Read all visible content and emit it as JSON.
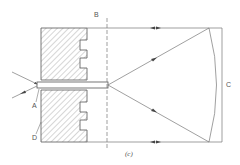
{
  "figure": {
    "caption": "(c)",
    "labels": {
      "A": "A",
      "B": "B",
      "C": "C",
      "D": "D"
    },
    "colors": {
      "line": "#666666",
      "hatch": "#777777",
      "background": "#ffffff"
    },
    "elements": [
      {
        "name": "upper-hatched-block",
        "type": "hatched-block-with-notches"
      },
      {
        "name": "lower-hatched-block",
        "type": "hatched-block-with-notches"
      },
      {
        "name": "central-slab",
        "type": "rectangle"
      },
      {
        "name": "plane-B",
        "type": "dashed-vertical-line"
      },
      {
        "name": "curved-surface",
        "type": "arc"
      },
      {
        "name": "boundary-C",
        "type": "vertical-line"
      },
      {
        "name": "ray-top",
        "type": "arrow-line"
      },
      {
        "name": "ray-bottom",
        "type": "arrow-line"
      },
      {
        "name": "diverging-ray-upper",
        "type": "arrow-line"
      },
      {
        "name": "diverging-ray-lower",
        "type": "arrow-line"
      },
      {
        "name": "incident-ray-upper-left",
        "type": "arrow-line"
      },
      {
        "name": "incident-ray-lower-left",
        "type": "arrow-line"
      }
    ]
  }
}
